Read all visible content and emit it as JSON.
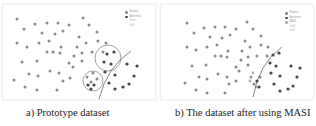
{
  "figure": {
    "panels": [
      {
        "id": "a",
        "caption": "a) Prototype dataset",
        "legend": [
          {
            "label": "Normal",
            "color": "#8a8a8a"
          },
          {
            "label": "Abnormal",
            "color": "#444444"
          },
          {
            "label": "t1=5",
            "color": null
          },
          {
            "label": "k=5",
            "color": null
          }
        ]
      },
      {
        "id": "b",
        "caption": "b) The dataset after using MASI",
        "legend": [
          {
            "label": "Normal",
            "color": "#8a8a8a"
          },
          {
            "label": "Abnormal",
            "color": "#444444"
          },
          {
            "label": "MASI",
            "color": "#b0b0b0"
          },
          {
            "label": "t1=5",
            "color": null
          },
          {
            "label": "k=5",
            "color": null
          }
        ]
      }
    ],
    "colors": {
      "normal": "#8a8a8a",
      "abnormal": "#444444",
      "masi": "#b0b0b0",
      "boundary": "#555555",
      "circle": "#666666"
    }
  }
}
